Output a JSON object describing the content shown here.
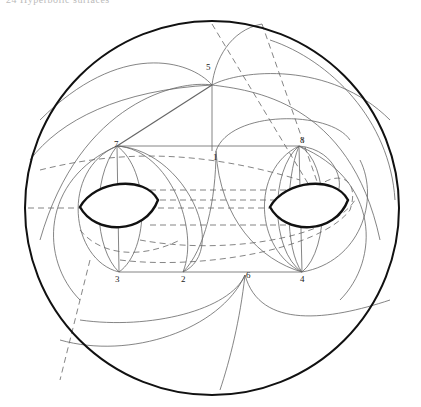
{
  "header": {
    "text": "24   Hyperbolic surfaces"
  },
  "figure": {
    "outer_circle": {
      "cx": 212,
      "cy": 208,
      "r": 187
    },
    "holes": [
      {
        "name": "left-hole",
        "cx": 118,
        "cy": 207
      },
      {
        "name": "right-hole",
        "cx": 310,
        "cy": 207
      }
    ],
    "vertices": [
      {
        "label": "1",
        "x": 216,
        "y": 151
      },
      {
        "label": "2",
        "x": 183,
        "y": 272
      },
      {
        "label": "3",
        "x": 119,
        "y": 272
      },
      {
        "label": "4",
        "x": 302,
        "y": 272
      },
      {
        "label": "5",
        "x": 212,
        "y": 85
      },
      {
        "label": "6",
        "x": 245,
        "y": 275
      },
      {
        "label": "7",
        "x": 117,
        "y": 146
      },
      {
        "label": "8",
        "x": 299,
        "y": 146
      }
    ],
    "colors": {
      "stroke": "#555555",
      "boundary": "#111111"
    }
  }
}
